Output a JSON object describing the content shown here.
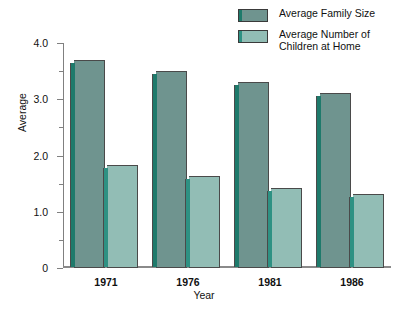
{
  "chart_data": {
    "type": "bar",
    "title": "",
    "xlabel": "Year",
    "ylabel": "Average",
    "categories": [
      "1971",
      "1976",
      "1981",
      "1986"
    ],
    "series": [
      {
        "name": "Average Family Size",
        "values": [
          3.7,
          3.5,
          3.3,
          3.12
        ],
        "color": "#6f948f",
        "edge_color": "#1e7a6b"
      },
      {
        "name": "Average Number of\nChildren at Home",
        "values": [
          1.83,
          1.63,
          1.43,
          1.32
        ],
        "color": "#92bdb5",
        "edge_color": "#2e9183"
      }
    ],
    "ylim": [
      0,
      4.0
    ],
    "ytick_labels": [
      "4.0",
      "3.0",
      "2.0",
      "1.0",
      "0"
    ],
    "ytick_values": [
      4.0,
      3.0,
      2.0,
      1.0,
      0
    ],
    "yminor_values": [
      3.5,
      2.5,
      1.5,
      0.5
    ],
    "grid": false,
    "legend_position": "top-right"
  },
  "legend": {
    "items": [
      {
        "label": "Average Family Size",
        "swatch": "dark-teal-swatch"
      },
      {
        "label": "Average Number of\nChildren at Home",
        "swatch": "light-teal-swatch"
      }
    ]
  },
  "axes": {
    "y_title": "Average",
    "x_title": "Year"
  }
}
